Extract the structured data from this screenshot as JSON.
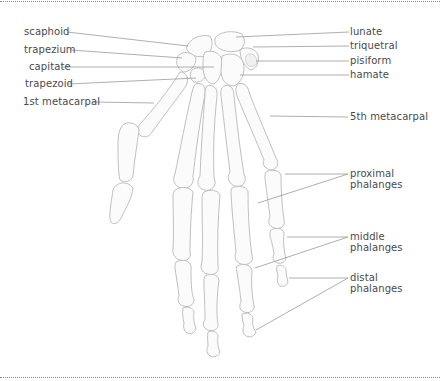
{
  "diagram": {
    "labels_left": [
      {
        "id": "scaphoid",
        "text": "scaphoid"
      },
      {
        "id": "trapezium",
        "text": "trapezium"
      },
      {
        "id": "capitate",
        "text": "capitate"
      },
      {
        "id": "trapezoid",
        "text": "trapezoid"
      },
      {
        "id": "first-metacarpal",
        "text": "1st metacarpal"
      }
    ],
    "labels_right": [
      {
        "id": "lunate",
        "text": "lunate"
      },
      {
        "id": "triquetral",
        "text": "triquetral"
      },
      {
        "id": "pisiform",
        "text": "pisiform"
      },
      {
        "id": "hamate",
        "text": "hamate"
      },
      {
        "id": "fifth-metacarpal",
        "text": "5th metacarpal"
      },
      {
        "id": "proximal-phalanges",
        "line1": "proximal",
        "line2": "phalanges"
      },
      {
        "id": "middle-phalanges",
        "line1": "middle",
        "line2": "phalanges"
      },
      {
        "id": "distal-phalanges",
        "line1": "distal",
        "line2": "phalanges"
      }
    ],
    "colors": {
      "bone_fill": "#fbfbfb",
      "bone_outline": "#b9b9b9",
      "leader_line": "#8c8c8c",
      "label_text": "#4a4a4a",
      "border": "#8a8a8a"
    }
  }
}
